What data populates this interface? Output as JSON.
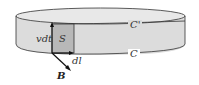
{
  "diagram": {
    "labels": {
      "top_curve": "C'",
      "bottom_curve": "C",
      "surface": "S",
      "displacement": "vdt",
      "line_element": "dl",
      "field": "B"
    },
    "colors": {
      "band_fill": "#dcdcdc",
      "top_fill": "#e6e6e6",
      "surface_fill": "#b8b8b8",
      "stroke": "#333333"
    }
  }
}
